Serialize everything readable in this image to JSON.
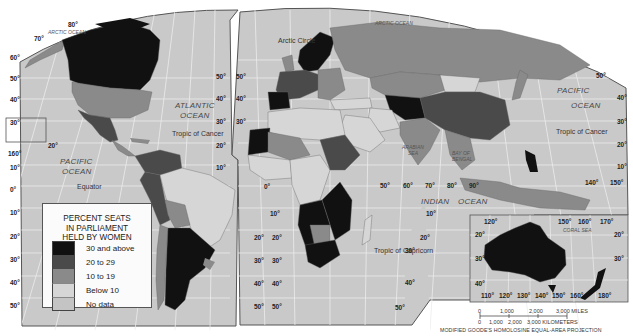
{
  "map": {
    "title": "PERCENT SEATS IN PARLIAMENT HELD BY WOMEN",
    "title_lines": [
      "PERCENT SEATS",
      "IN PARLIAMENT",
      "HELD BY WOMEN"
    ],
    "projection": "MODIFIED GOODE'S HOMOLOSINE EQUAL-AREA PROJECTION",
    "colors": {
      "ocean": "#c9c9c9",
      "graticule": "#ececec",
      "class_30_above": "#111111",
      "class_20_29": "#4a4a4a",
      "class_10_19": "#8a8a8a",
      "class_below_10": "#d6d6d6",
      "class_no_data": "#bdbdbd",
      "border": "#666666"
    }
  },
  "legend": {
    "items": [
      {
        "label": "30 and above",
        "color": "#111111"
      },
      {
        "label": "20 to 29",
        "color": "#4a4a4a"
      },
      {
        "label": "10 to 19",
        "color": "#8a8a8a"
      },
      {
        "label": "Below 10",
        "color": "#d6d6d6"
      },
      {
        "label": "No data",
        "color": "#c4c4c4"
      }
    ]
  },
  "labels": {
    "oceans": {
      "arctic_left": "ARCTIC OCEAN",
      "arctic_right": "ARCTIC OCEAN",
      "atlantic_1": "ATLANTIC",
      "atlantic_2": "OCEAN",
      "pacific_left_1": "PACIFIC",
      "pacific_left_2": "OCEAN",
      "pacific_right_1": "PACIFIC",
      "pacific_right_2": "OCEAN",
      "indian": "INDIAN",
      "indian_2": "OCEAN",
      "arabian_1": "ARABIAN",
      "arabian_2": "SEA",
      "bengal_1": "BAY OF",
      "bengal_2": "BENGAL",
      "coral": "CORAL SEA"
    },
    "lines": {
      "arctic_circle": "Arctic Circle",
      "tropic_cancer_left": "Tropic of Cancer",
      "tropic_cancer_right": "Tropic of Cancer",
      "equator": "Equator",
      "tropic_capricorn": "Tropic of Capricorn"
    },
    "ticks": {
      "lat_80": "80°",
      "lat_70": "70°",
      "lat_60": "60°",
      "lat_50": "50°",
      "lat_40": "40°",
      "lat_30": "30°",
      "lat_20": "20°",
      "lat_10": "10°",
      "lat_0": "0°",
      "lon_160": "160°",
      "lon_0": "0°",
      "lon_50": "50°",
      "lon_60": "60°",
      "lon_70": "70°",
      "lon_80": "80°",
      "lon_90": "90°",
      "lon_140": "140°",
      "lon_150": "150°",
      "au_110": "110°",
      "au_120": "120°",
      "au_130": "130°",
      "au_140": "140°",
      "au_150": "150°",
      "au_160": "160°",
      "au_170": "170°",
      "au_180": "180°"
    }
  },
  "scale": {
    "miles": [
      "0",
      "1,000",
      "2,000",
      "3,000 MILES"
    ],
    "km": [
      "0",
      "1,000",
      "2,000",
      "3,000 KILOMETERS"
    ]
  }
}
